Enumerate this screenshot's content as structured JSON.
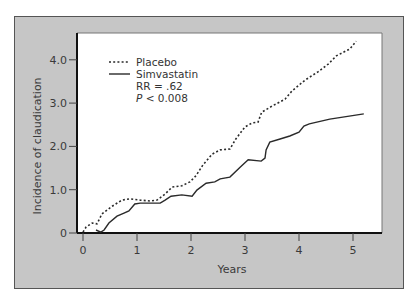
{
  "chart_data": {
    "type": "line",
    "title": "",
    "xlabel": "Years",
    "ylabel": "Incidence of claudication",
    "xlim": [
      0,
      5.2
    ],
    "ylim": [
      0,
      4.5
    ],
    "x_ticks": [
      "0",
      "1",
      "2",
      "3",
      "4",
      "5"
    ],
    "y_ticks": [
      "0",
      "1.0",
      "2.0",
      "3.0",
      "4.0"
    ],
    "grid": false,
    "legend_position": "upper left (inside plot)",
    "annotations": [
      "RR = .62",
      "P < 0.008"
    ],
    "series": [
      {
        "name": "Placebo",
        "style": "dotted",
        "points": [
          [
            0,
            0.02
          ],
          [
            0.06,
            0.14
          ],
          [
            0.17,
            0.23
          ],
          [
            0.26,
            0.21
          ],
          [
            0.35,
            0.44
          ],
          [
            0.54,
            0.62
          ],
          [
            0.72,
            0.76
          ],
          [
            0.87,
            0.79
          ],
          [
            1.06,
            0.76
          ],
          [
            1.24,
            0.74
          ],
          [
            1.37,
            0.76
          ],
          [
            1.52,
            0.9
          ],
          [
            1.65,
            1.06
          ],
          [
            1.83,
            1.09
          ],
          [
            1.98,
            1.18
          ],
          [
            2.09,
            1.32
          ],
          [
            2.22,
            1.57
          ],
          [
            2.39,
            1.82
          ],
          [
            2.54,
            1.92
          ],
          [
            2.72,
            1.94
          ],
          [
            2.83,
            2.17
          ],
          [
            3.0,
            2.45
          ],
          [
            3.13,
            2.54
          ],
          [
            3.24,
            2.56
          ],
          [
            3.31,
            2.79
          ],
          [
            3.5,
            2.93
          ],
          [
            3.74,
            3.09
          ],
          [
            3.87,
            3.28
          ],
          [
            4.11,
            3.53
          ],
          [
            4.35,
            3.72
          ],
          [
            4.54,
            3.9
          ],
          [
            4.69,
            4.09
          ],
          [
            4.94,
            4.25
          ],
          [
            5.06,
            4.43
          ]
        ]
      },
      {
        "name": "Simvastatin",
        "style": "solid",
        "points": [
          [
            0.24,
            0.07
          ],
          [
            0.33,
            0.02
          ],
          [
            0.39,
            0.07
          ],
          [
            0.48,
            0.23
          ],
          [
            0.63,
            0.39
          ],
          [
            0.76,
            0.46
          ],
          [
            0.85,
            0.51
          ],
          [
            0.96,
            0.67
          ],
          [
            1.06,
            0.69
          ],
          [
            1.43,
            0.69
          ],
          [
            1.52,
            0.76
          ],
          [
            1.63,
            0.85
          ],
          [
            1.83,
            0.88
          ],
          [
            2.02,
            0.85
          ],
          [
            2.11,
            0.99
          ],
          [
            2.28,
            1.15
          ],
          [
            2.44,
            1.18
          ],
          [
            2.54,
            1.25
          ],
          [
            2.72,
            1.29
          ],
          [
            2.91,
            1.52
          ],
          [
            3.06,
            1.69
          ],
          [
            3.3,
            1.66
          ],
          [
            3.37,
            1.73
          ],
          [
            3.39,
            1.92
          ],
          [
            3.46,
            2.1
          ],
          [
            3.65,
            2.17
          ],
          [
            3.83,
            2.24
          ],
          [
            4.0,
            2.33
          ],
          [
            4.09,
            2.47
          ],
          [
            4.19,
            2.52
          ],
          [
            4.57,
            2.63
          ],
          [
            5.2,
            2.75
          ]
        ]
      }
    ]
  },
  "legend": {
    "placebo": "Placebo",
    "simvastatin": "Simvastatin",
    "rr": "RR = .62",
    "p_prefix": "P",
    "p_suffix": " < 0.008"
  },
  "colors": {
    "frame": "#c6c6c6",
    "plot_bg": "#ffffff",
    "line": "#2a2a2a"
  }
}
